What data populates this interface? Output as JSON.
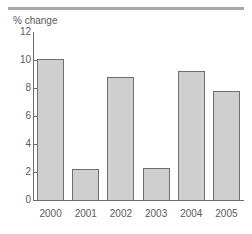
{
  "chart_data": {
    "type": "bar",
    "title": "",
    "subtitle": "",
    "xlabel": "",
    "ylabel": "% change",
    "categories": [
      "2000",
      "2001",
      "2002",
      "2003",
      "2004",
      "2005"
    ],
    "values": [
      10.1,
      2.2,
      8.8,
      2.3,
      9.2,
      7.8
    ],
    "ylim": [
      0,
      12
    ],
    "ytick_labels": [
      "0",
      "2",
      "4",
      "6",
      "8",
      "10",
      "12"
    ],
    "ytick_values": [
      0,
      2,
      4,
      6,
      8,
      10,
      12
    ],
    "grid": false,
    "legend": null,
    "annotations": [],
    "colors": {
      "bar_fill": "#cfcfcf",
      "bar_border": "#6e6e6e",
      "axis": "#6a6a6a",
      "text": "#5a5a5a",
      "rule": "#a8a8a8",
      "background": "#ffffff"
    }
  }
}
